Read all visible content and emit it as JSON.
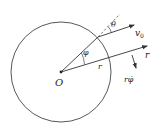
{
  "diagram": {
    "labels": {
      "origin": "O",
      "phi": "φ",
      "theta": "θ",
      "v0": "v",
      "v0_sub": "0",
      "r_radius": "r",
      "r_direction": "r",
      "r_phidot": "rφ̇"
    },
    "colors": {
      "stroke": "#333333",
      "background": "#ffffff"
    }
  }
}
